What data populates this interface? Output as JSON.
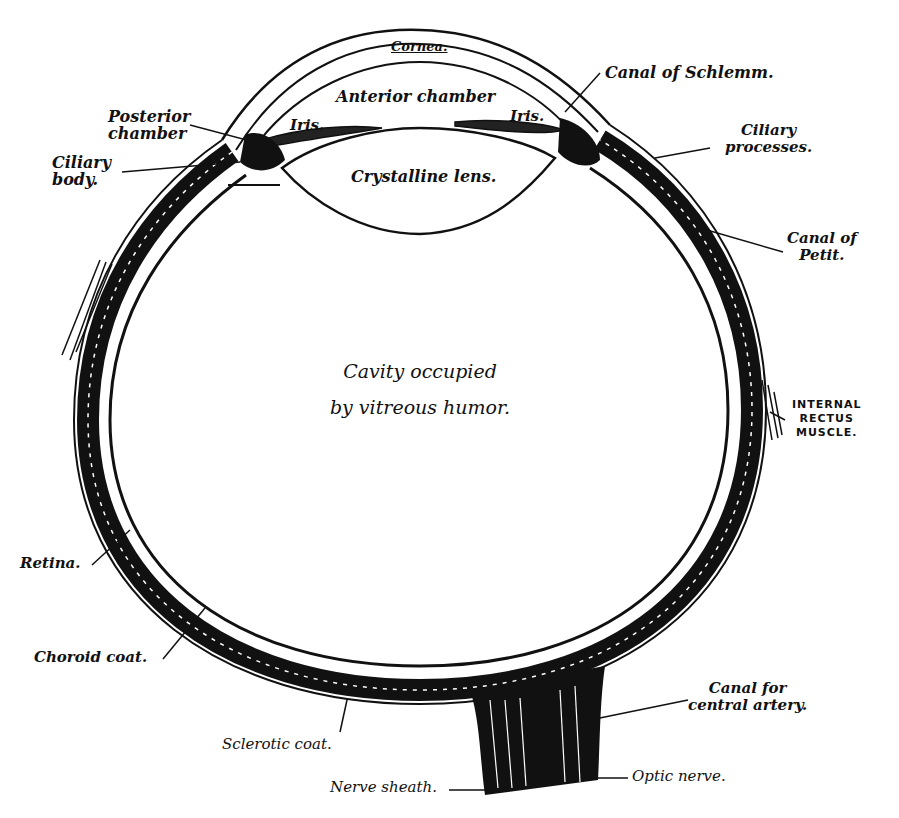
{
  "diagram": {
    "center_label": {
      "line1": "Cavity occupied",
      "line2": "by vitreous humor."
    },
    "labels": {
      "cornea": "Cornea.",
      "anterior_chamber": "Anterior chamber",
      "iris_left": "Iris.",
      "iris_right": "Iris.",
      "canal_of_schlemm": "Canal of Schlemm.",
      "posterior_chamber_1": "Posterior",
      "posterior_chamber_2": "chamber",
      "ciliary_body_1": "Ciliary",
      "ciliary_body_2": "body.",
      "crystalline_lens": "Crystalline lens.",
      "ciliary_processes_1": "Ciliary",
      "ciliary_processes_2": "processes.",
      "canal_of_petit_1": "Canal of",
      "canal_of_petit_2": "Petit.",
      "internal_rectus_1": "INTERNAL",
      "internal_rectus_2": "RECTUS",
      "internal_rectus_3": "MUSCLE.",
      "retina": "Retina.",
      "choroid_coat": "Choroid coat.",
      "sclerotic_coat": "Sclerotic coat.",
      "canal_central_artery_1": "Canal for",
      "canal_central_artery_2": "central artery.",
      "nerve_sheath": "Nerve sheath.",
      "optic_nerve": "Optic nerve."
    },
    "colors": {
      "ink": "#111111",
      "paper": "#ffffff"
    }
  }
}
